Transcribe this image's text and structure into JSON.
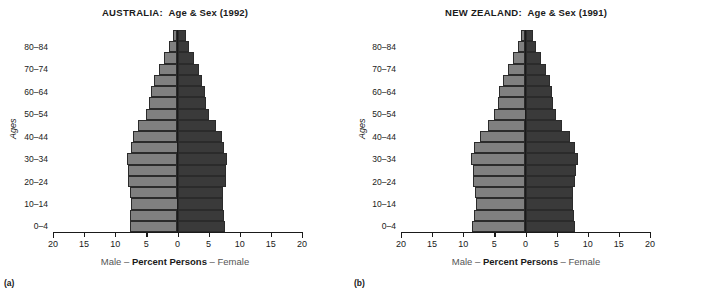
{
  "panels": [
    {
      "letter": "(a)",
      "title_country": "AUSTRALIA:",
      "title_rest": "Age & Sex (1992)",
      "y_axis_title": "Ages",
      "x_title_left": "Male – ",
      "x_title_mid": "Percent Persons",
      "x_title_right": " – Female"
    },
    {
      "letter": "(b)",
      "title_country": "NEW ZEALAND:",
      "title_rest": "Age & Sex (1991)",
      "y_axis_title": "Ages",
      "x_title_left": "Male – ",
      "x_title_mid": "Percent Persons",
      "x_title_right": " – Female"
    }
  ],
  "axis": {
    "x_ticks": [
      20,
      15,
      10,
      5,
      0,
      5,
      10,
      15,
      20
    ],
    "x_tick_labels": [
      "20",
      "15",
      "10",
      "5",
      "0",
      "5",
      "10",
      "15",
      "20"
    ],
    "x_max": 20,
    "y_tick_labels": [
      "80–84",
      "70–74",
      "60–64",
      "50–54",
      "40–44",
      "30–34",
      "20–24",
      "10–14",
      "0–4"
    ],
    "y_tick_groups": [
      "80-84",
      "70-74",
      "60-64",
      "50-54",
      "40-44",
      "30-34",
      "20-24",
      "10-14",
      "0-4"
    ]
  },
  "colors": {
    "male_bar": "#808080",
    "female_bar": "#3a3a3a",
    "axis": "#1a1a1a",
    "background": "#ffffff"
  },
  "chart_data": [
    {
      "type": "bar",
      "subtype": "population-pyramid",
      "title": "AUSTRALIA:  Age & Sex (1992)",
      "xlabel": "Male – Percent Persons – Female",
      "ylabel": "Ages",
      "xlim": [
        -20,
        20
      ],
      "grid": false,
      "legend": "none",
      "categories": [
        "0-4",
        "5-9",
        "10-14",
        "15-19",
        "20-24",
        "25-29",
        "30-34",
        "35-39",
        "40-44",
        "45-49",
        "50-54",
        "55-59",
        "60-64",
        "65-69",
        "70-74",
        "75-79",
        "80-84",
        "85+"
      ],
      "series": [
        {
          "name": "Male",
          "side": "left",
          "values": [
            7.7,
            7.6,
            7.5,
            7.6,
            8.0,
            7.9,
            8.1,
            7.5,
            7.2,
            6.3,
            5.1,
            4.5,
            4.3,
            3.8,
            3.0,
            2.2,
            1.3,
            0.8
          ]
        },
        {
          "name": "Female",
          "side": "right",
          "values": [
            7.6,
            7.4,
            7.3,
            7.3,
            7.8,
            7.8,
            8.0,
            7.4,
            7.1,
            6.2,
            5.0,
            4.5,
            4.4,
            4.0,
            3.4,
            2.7,
            1.9,
            1.3
          ]
        }
      ]
    },
    {
      "type": "bar",
      "subtype": "population-pyramid",
      "title": "NEW ZEALAND:  Age & Sex (1991)",
      "xlabel": "Male – Percent Persons – Female",
      "ylabel": "Ages",
      "xlim": [
        -20,
        20
      ],
      "grid": false,
      "legend": "none",
      "categories": [
        "0-4",
        "5-9",
        "10-14",
        "15-19",
        "20-24",
        "25-29",
        "30-34",
        "35-39",
        "40-44",
        "45-49",
        "50-54",
        "55-59",
        "60-64",
        "65-69",
        "70-74",
        "75-79",
        "80-84",
        "85+"
      ],
      "series": [
        {
          "name": "Male",
          "side": "left",
          "values": [
            8.6,
            8.3,
            8.0,
            8.1,
            8.4,
            8.4,
            8.7,
            8.3,
            7.3,
            6.0,
            5.0,
            4.4,
            4.2,
            3.6,
            2.8,
            2.0,
            1.2,
            0.7
          ]
        },
        {
          "name": "Female",
          "side": "right",
          "values": [
            8.0,
            7.8,
            7.6,
            7.7,
            8.0,
            8.1,
            8.4,
            8.0,
            7.1,
            5.9,
            4.9,
            4.4,
            4.3,
            3.9,
            3.3,
            2.5,
            1.7,
            1.2
          ]
        }
      ]
    }
  ]
}
